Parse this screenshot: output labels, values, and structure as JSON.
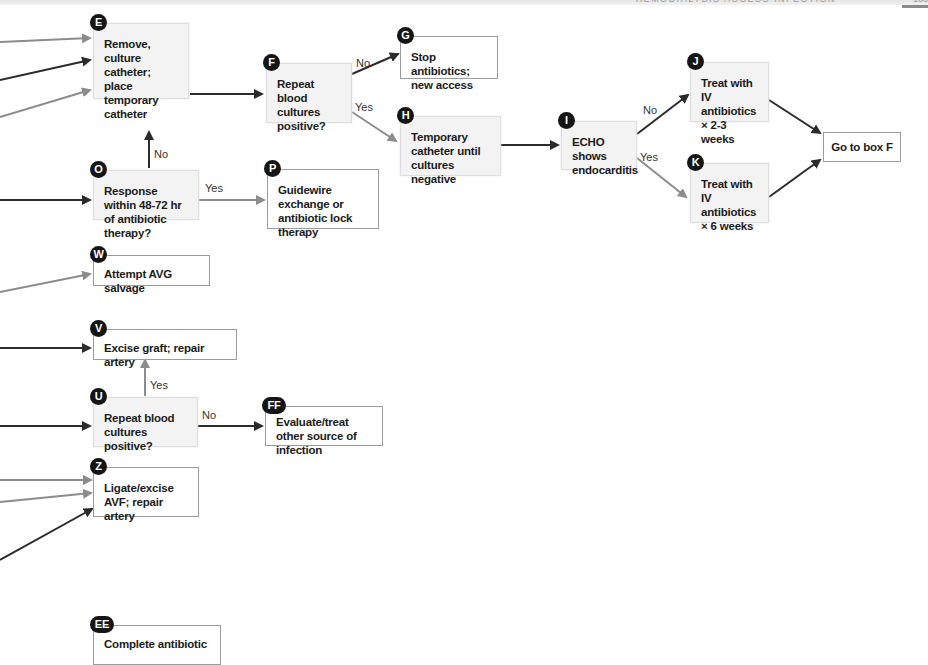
{
  "header": {
    "running_title": "HEMODIALYSIS ACCESS INFECTION",
    "page_number": "133"
  },
  "nodes": {
    "E": {
      "badge": "E",
      "text": "Remove, culture catheter; place temporary catheter"
    },
    "F": {
      "badge": "F",
      "text": "Repeat blood cultures positive?"
    },
    "G": {
      "badge": "G",
      "text": "Stop antibiotics; new access"
    },
    "H": {
      "badge": "H",
      "text": "Temporary catheter until cultures negative"
    },
    "I": {
      "badge": "I",
      "text": "ECHO shows endocarditis"
    },
    "J": {
      "badge": "J",
      "text": "Treat with IV antibiotics × 2-3 weeks"
    },
    "K": {
      "badge": "K",
      "text": "Treat with IV antibiotics × 6 weeks"
    },
    "GOTO": {
      "text": "Go to box F"
    },
    "O": {
      "badge": "O",
      "text": "Response within 48-72 hr of antibiotic therapy?"
    },
    "P": {
      "badge": "P",
      "text": "Guidewire exchange or antibiotic lock therapy"
    },
    "W": {
      "badge": "W",
      "text": "Attempt AVG salvage"
    },
    "V": {
      "badge": "V",
      "text": "Excise graft; repair artery"
    },
    "U": {
      "badge": "U",
      "text": "Repeat blood cultures positive?"
    },
    "FF": {
      "badge": "FF",
      "text": "Evaluate/treat other source of infection"
    },
    "Z": {
      "badge": "Z",
      "text": "Ligate/excise AVF; repair artery"
    },
    "EE": {
      "badge": "EE",
      "text": "Complete antibiotic"
    }
  },
  "edge_labels": {
    "F_G": "No",
    "F_H": "Yes",
    "O_E": "No",
    "O_P": "Yes",
    "I_J": "No",
    "I_K": "Yes",
    "U_V": "Yes",
    "U_FF": "No"
  },
  "colors": {
    "arrow_dark": "#2b2b2b",
    "arrow_gray": "#8c8c8c",
    "decision_fill": "#f3f3f3",
    "action_border": "#9b9b9b",
    "badge_fill": "#151515"
  }
}
